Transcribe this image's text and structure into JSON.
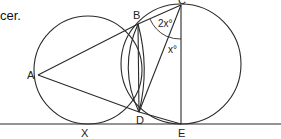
{
  "caption_fragment": "cer.",
  "points": {
    "A": {
      "label": "A",
      "x": 38,
      "y": 75
    },
    "B": {
      "label": "B",
      "x": 138,
      "y": 24
    },
    "C": {
      "label": "C",
      "x": 181,
      "y": 5
    },
    "D": {
      "label": "D",
      "x": 139,
      "y": 112
    },
    "E": {
      "label": "E",
      "x": 181,
      "y": 124
    },
    "X": {
      "label": "X",
      "x": 88,
      "y": 124
    }
  },
  "angles": {
    "upper": "2x°",
    "lower": "x°"
  },
  "colors": {
    "stroke": "#2a2a2a",
    "background": "#ffffff"
  }
}
